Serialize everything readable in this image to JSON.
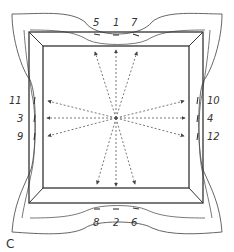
{
  "diagram": {
    "caption": "C",
    "top_labels": [
      "5",
      "1",
      "7"
    ],
    "bottom_labels": [
      "8",
      "2",
      "6"
    ],
    "left_labels": [
      "11",
      "3",
      "9"
    ],
    "right_labels": [
      "10",
      "4",
      "12"
    ],
    "marks": {
      "top": [
        "–",
        "–",
        "–"
      ],
      "bottom": [
        "–",
        "–",
        "–"
      ],
      "left": [
        "l",
        "l",
        "l"
      ],
      "right": [
        "l",
        "l",
        "l"
      ]
    },
    "line_color": "#444444",
    "dash_color": "#555555"
  }
}
